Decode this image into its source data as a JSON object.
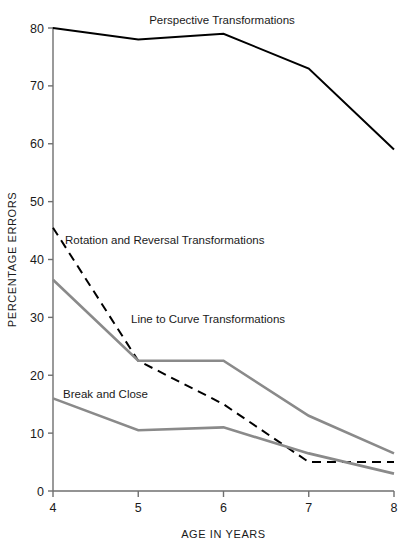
{
  "chart_data": {
    "type": "line",
    "title": "",
    "xlabel": "AGE IN YEARS",
    "ylabel": "PERCENTAGE ERRORS",
    "x": [
      4,
      5,
      6,
      7,
      8
    ],
    "xticklabels": [
      "4",
      "5",
      "6",
      "7",
      "8"
    ],
    "yticklabels": [
      "0",
      "10",
      "20",
      "30",
      "40",
      "50",
      "60",
      "70",
      "80"
    ],
    "yticks": [
      0,
      10,
      20,
      30,
      40,
      50,
      60,
      70,
      80
    ],
    "xlim": [
      4,
      8
    ],
    "ylim": [
      0,
      80
    ],
    "grid": false,
    "legend_position": "inline-annotations",
    "series": [
      {
        "name": "Perspective Transformations",
        "values": [
          80,
          78,
          79,
          73,
          59
        ],
        "color": "#000000",
        "style": "solid",
        "width": 2,
        "label_x": 222,
        "label_y": 24,
        "label_anchor": "middle"
      },
      {
        "name": "Rotation and Reversal Transformations",
        "values": [
          45.5,
          22.5,
          15,
          5,
          5
        ],
        "color": "#000000",
        "style": "dashed",
        "width": 2,
        "label_x": 65,
        "label_y": 244,
        "label_anchor": "start"
      },
      {
        "name": "Line to Curve Transformations",
        "values": [
          36.5,
          22.5,
          22.5,
          13,
          6.5
        ],
        "color": "#8a8a8a",
        "style": "solid",
        "width": 2.6,
        "label_x": 131,
        "label_y": 323,
        "label_anchor": "start"
      },
      {
        "name": "Break and Close",
        "values": [
          16,
          10.5,
          11,
          6.5,
          3
        ],
        "color": "#8a8a8a",
        "style": "solid",
        "width": 2.6,
        "label_x": 63,
        "label_y": 398,
        "label_anchor": "start"
      }
    ]
  },
  "axes": {
    "axis_color": "#6f6f6f",
    "text_color": "#1a1a1a"
  }
}
